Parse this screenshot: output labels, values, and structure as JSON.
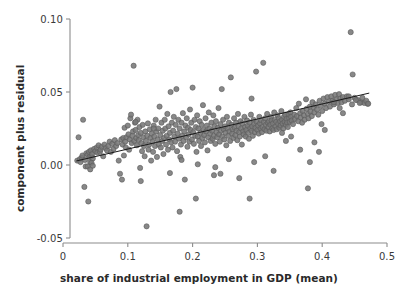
{
  "chart_data": {
    "type": "scatter",
    "title": "",
    "subtitle": "",
    "xlabel": "share of industrial employment in GDP (mean)",
    "ylabel": "component plus residual",
    "xlim": [
      0.0,
      0.5
    ],
    "ylim": [
      -0.05,
      0.1
    ],
    "xticks": [
      0,
      0.1,
      0.2,
      0.3,
      0.4,
      0.5
    ],
    "xticklabels": [
      "0",
      "0.1",
      "0.2",
      "0.3",
      "0.4",
      "0.5"
    ],
    "yticks": [
      -0.05,
      0.0,
      0.05,
      0.1
    ],
    "yticklabels": [
      "-0.05",
      "0.00",
      "0.05",
      "0.10"
    ],
    "grid": false,
    "legend": null,
    "marker": {
      "shape": "circle",
      "fill_color": "#787878",
      "edge_color": "#5a5a5a",
      "size_px": 5.2,
      "opacity": 0.88
    },
    "fit_line": {
      "name": "component-plus-residual fit",
      "color": "#1a1a1a",
      "width_px": 1.0,
      "x_start": 0.021,
      "y_start": 0.0028,
      "x_end": 0.472,
      "y_end": 0.0492,
      "slope": 0.1028,
      "intercept": 0.00064
    },
    "n_points": 402,
    "series": [
      {
        "name": "observations",
        "x": [
          0.022,
          0.024,
          0.026,
          0.027,
          0.029,
          0.03,
          0.031,
          0.033,
          0.034,
          0.035,
          0.036,
          0.038,
          0.039,
          0.04,
          0.041,
          0.042,
          0.043,
          0.044,
          0.045,
          0.046,
          0.048,
          0.05,
          0.052,
          0.053,
          0.055,
          0.057,
          0.058,
          0.06,
          0.062,
          0.064,
          0.066,
          0.068,
          0.07,
          0.072,
          0.074,
          0.076,
          0.078,
          0.08,
          0.082,
          0.084,
          0.086,
          0.088,
          0.09,
          0.091,
          0.092,
          0.093,
          0.094,
          0.095,
          0.096,
          0.097,
          0.098,
          0.1,
          0.101,
          0.102,
          0.103,
          0.104,
          0.105,
          0.106,
          0.107,
          0.108,
          0.109,
          0.11,
          0.111,
          0.112,
          0.113,
          0.114,
          0.115,
          0.116,
          0.117,
          0.118,
          0.119,
          0.12,
          0.121,
          0.122,
          0.123,
          0.124,
          0.125,
          0.126,
          0.127,
          0.128,
          0.129,
          0.13,
          0.131,
          0.132,
          0.133,
          0.134,
          0.135,
          0.136,
          0.137,
          0.138,
          0.139,
          0.14,
          0.141,
          0.142,
          0.143,
          0.144,
          0.145,
          0.146,
          0.147,
          0.148,
          0.149,
          0.15,
          0.151,
          0.152,
          0.153,
          0.154,
          0.155,
          0.156,
          0.157,
          0.158,
          0.159,
          0.16,
          0.161,
          0.162,
          0.163,
          0.164,
          0.165,
          0.166,
          0.167,
          0.168,
          0.169,
          0.17,
          0.171,
          0.172,
          0.173,
          0.174,
          0.175,
          0.176,
          0.177,
          0.178,
          0.179,
          0.18,
          0.181,
          0.182,
          0.183,
          0.184,
          0.185,
          0.186,
          0.187,
          0.188,
          0.189,
          0.19,
          0.191,
          0.192,
          0.193,
          0.194,
          0.195,
          0.196,
          0.197,
          0.198,
          0.199,
          0.2,
          0.201,
          0.202,
          0.203,
          0.204,
          0.205,
          0.206,
          0.207,
          0.208,
          0.209,
          0.21,
          0.211,
          0.212,
          0.213,
          0.214,
          0.215,
          0.216,
          0.217,
          0.218,
          0.219,
          0.22,
          0.221,
          0.222,
          0.223,
          0.224,
          0.225,
          0.226,
          0.227,
          0.228,
          0.229,
          0.23,
          0.231,
          0.232,
          0.233,
          0.234,
          0.235,
          0.236,
          0.237,
          0.238,
          0.239,
          0.24,
          0.241,
          0.242,
          0.243,
          0.244,
          0.245,
          0.246,
          0.247,
          0.248,
          0.249,
          0.25,
          0.251,
          0.252,
          0.253,
          0.254,
          0.255,
          0.256,
          0.257,
          0.258,
          0.259,
          0.26,
          0.261,
          0.262,
          0.263,
          0.264,
          0.265,
          0.266,
          0.267,
          0.268,
          0.269,
          0.27,
          0.271,
          0.272,
          0.273,
          0.274,
          0.275,
          0.276,
          0.277,
          0.278,
          0.279,
          0.28,
          0.281,
          0.282,
          0.283,
          0.284,
          0.285,
          0.286,
          0.287,
          0.288,
          0.289,
          0.29,
          0.291,
          0.292,
          0.293,
          0.294,
          0.295,
          0.296,
          0.297,
          0.298,
          0.299,
          0.3,
          0.301,
          0.302,
          0.303,
          0.304,
          0.305,
          0.306,
          0.307,
          0.308,
          0.309,
          0.31,
          0.311,
          0.312,
          0.313,
          0.314,
          0.315,
          0.316,
          0.317,
          0.318,
          0.319,
          0.32,
          0.321,
          0.322,
          0.323,
          0.324,
          0.325,
          0.326,
          0.327,
          0.328,
          0.329,
          0.33,
          0.331,
          0.332,
          0.333,
          0.334,
          0.335,
          0.336,
          0.337,
          0.338,
          0.339,
          0.34,
          0.341,
          0.342,
          0.343,
          0.344,
          0.345,
          0.346,
          0.347,
          0.348,
          0.349,
          0.35,
          0.351,
          0.352,
          0.353,
          0.355,
          0.357,
          0.358,
          0.36,
          0.361,
          0.363,
          0.364,
          0.366,
          0.367,
          0.369,
          0.37,
          0.372,
          0.373,
          0.375,
          0.376,
          0.378,
          0.379,
          0.381,
          0.382,
          0.384,
          0.385,
          0.387,
          0.388,
          0.39,
          0.392,
          0.394,
          0.396,
          0.398,
          0.4,
          0.402,
          0.404,
          0.406,
          0.408,
          0.41,
          0.412,
          0.414,
          0.416,
          0.418,
          0.42,
          0.422,
          0.424,
          0.426,
          0.428,
          0.43,
          0.432,
          0.435,
          0.438,
          0.441,
          0.444,
          0.447,
          0.45,
          0.455,
          0.46,
          0.465,
          0.47,
          0.038,
          0.042,
          0.044,
          0.046,
          0.112,
          0.14,
          0.18,
          0.183,
          0.205,
          0.233,
          0.243,
          0.256,
          0.272,
          0.288,
          0.291,
          0.295,
          0.312,
          0.325,
          0.338,
          0.344,
          0.352,
          0.366,
          0.378,
          0.381,
          0.388,
          0.395,
          0.399,
          0.404,
          0.418,
          0.427,
          0.432,
          0.441,
          0.446,
          0.452,
          0.458,
          0.462,
          0.468,
          0.471,
          0.12,
          0.165,
          0.208,
          0.235
        ],
        "y": [
          0.003,
          0.019,
          0.004,
          0.002,
          0.005,
          0.0065,
          0.031,
          -0.015,
          0.0035,
          -0.001,
          0.008,
          0.007,
          -0.025,
          0.009,
          0.0055,
          0.002,
          0.01,
          0.006,
          0.0075,
          0.0045,
          0.011,
          0.0095,
          0.012,
          0.0085,
          0.0135,
          0.009,
          0.0105,
          0.0125,
          0.006,
          0.014,
          0.0115,
          0.01,
          0.013,
          0.016,
          0.009,
          0.0145,
          0.011,
          0.017,
          0.013,
          0.015,
          0.003,
          -0.006,
          0.0175,
          -0.01,
          0.014,
          0.0185,
          0.0065,
          0.0255,
          0.016,
          0.012,
          0.019,
          0.027,
          0.021,
          0.0105,
          0.0175,
          0.032,
          0.0345,
          0.015,
          0.02,
          0.023,
          0.068,
          0.0165,
          0.029,
          0.024,
          0.0185,
          0.0135,
          0.031,
          0.0205,
          0.017,
          0.026,
          -0.002,
          0.022,
          0.015,
          0.0095,
          0.0275,
          0.019,
          0.013,
          0.006,
          0.023,
          0.0165,
          -0.042,
          0.02,
          0.0285,
          0.0105,
          0.014,
          0.0245,
          0.0185,
          0.003,
          0.0215,
          0.016,
          0.009,
          0.027,
          0.0195,
          0.013,
          0.031,
          0.023,
          0.0055,
          0.0175,
          0.025,
          0.014,
          0.04,
          0.0205,
          0.012,
          0.029,
          0.0165,
          0.0235,
          0.0075,
          0.0185,
          0.031,
          0.025,
          0.014,
          0.02,
          0.035,
          0.0105,
          0.0265,
          0.0175,
          0.022,
          0.05,
          0.0155,
          0.029,
          0.012,
          0.0235,
          0.033,
          0.0195,
          0.016,
          0.0275,
          0.052,
          0.0095,
          0.0215,
          0.031,
          0.018,
          0.025,
          0.0055,
          0.014,
          0.029,
          0.02,
          0.0355,
          0.0165,
          0.023,
          -0.01,
          0.027,
          0.019,
          0.032,
          0.0125,
          0.0255,
          0.021,
          0.016,
          0.038,
          0.024,
          0.029,
          0.0175,
          0.053,
          0.0225,
          0.0145,
          0.031,
          0.02,
          0.026,
          0.009,
          0.034,
          0.0195,
          0.025,
          0.0165,
          0.03,
          0.022,
          0.013,
          0.0275,
          0.0185,
          0.041,
          0.024,
          0.0205,
          0.0155,
          0.032,
          0.023,
          0.027,
          0.01,
          0.019,
          0.036,
          0.025,
          0.0215,
          0.0165,
          0.029,
          0.0235,
          0.018,
          0.034,
          0.02,
          0.0265,
          0.0145,
          0.03,
          0.0225,
          0.019,
          0.0255,
          0.039,
          0.021,
          0.016,
          0.028,
          0.0235,
          0.052,
          0.0195,
          0.031,
          0.0245,
          0.0175,
          0.0265,
          0.022,
          0.0135,
          0.033,
          0.025,
          0.02,
          0.029,
          0.023,
          0.0165,
          0.06,
          0.0275,
          0.0215,
          0.0245,
          0.0185,
          0.032,
          0.0255,
          0.0205,
          0.029,
          0.0235,
          0.017,
          0.035,
          0.0265,
          0.0225,
          0.0195,
          0.03,
          0.025,
          0.014,
          0.0285,
          0.023,
          0.021,
          0.033,
          0.026,
          0.0195,
          0.024,
          0.0305,
          0.027,
          0.022,
          0.018,
          0.029,
          0.025,
          0.0345,
          0.0235,
          0.0265,
          0.02,
          0.031,
          0.028,
          0.0225,
          0.0255,
          0.064,
          0.0295,
          0.024,
          0.027,
          0.0215,
          0.033,
          0.0285,
          0.025,
          0.0305,
          0.0225,
          0.026,
          0.07,
          0.0295,
          0.0245,
          0.032,
          0.0275,
          0.0235,
          0.035,
          0.029,
          0.026,
          0.03,
          0.023,
          0.0275,
          0.033,
          0.0305,
          0.025,
          0.0285,
          0.024,
          0.036,
          0.031,
          0.0265,
          0.0295,
          0.0245,
          0.034,
          0.028,
          0.032,
          0.0255,
          0.03,
          0.027,
          0.037,
          0.031,
          0.0285,
          0.025,
          0.033,
          0.0295,
          0.0345,
          0.0275,
          0.0315,
          0.029,
          0.026,
          0.035,
          0.032,
          0.0295,
          0.036,
          0.033,
          0.0305,
          0.028,
          0.0345,
          0.0315,
          0.039,
          0.0335,
          0.03,
          0.042,
          0.0355,
          0.0325,
          0.029,
          0.037,
          0.034,
          0.031,
          0.045,
          0.0385,
          0.035,
          0.032,
          0.04,
          0.0365,
          0.0335,
          0.043,
          0.0395,
          0.036,
          0.0415,
          0.038,
          0.0345,
          0.044,
          0.0405,
          0.037,
          0.0455,
          0.042,
          0.039,
          0.0465,
          0.0435,
          0.04,
          0.047,
          0.044,
          0.0415,
          0.048,
          0.045,
          0.0425,
          0.0485,
          0.0455,
          0.043,
          0.0465,
          0.044,
          0.047,
          0.045,
          0.091,
          0.062,
          0.046,
          0.0445,
          0.043,
          0.0425,
          0.042,
          -0.001,
          -0.003,
          0.0015,
          -0.0005,
          0.0295,
          0.025,
          -0.032,
          0.0035,
          -0.023,
          -0.007,
          -0.006,
          0.004,
          -0.009,
          -0.023,
          0.0455,
          0.002,
          0.006,
          -0.004,
          0.022,
          0.0165,
          0.0195,
          0.0105,
          -0.016,
          0.002,
          0.0155,
          0.009,
          0.028,
          0.024,
          0.043,
          0.039,
          0.0355,
          0.047,
          0.0415,
          0.0445,
          0.0425,
          0.046,
          0.044,
          0.042,
          -0.011,
          -0.0055,
          0.0005,
          -0.0015
        ],
        "color": "#787878"
      }
    ]
  },
  "axes_geometry": {
    "left_px": 70,
    "right_px": 390,
    "top_px": 19,
    "bottom_px": 238,
    "x_px_0": 63,
    "x_px_per_unit": 648,
    "y_px_0": 165,
    "y_px_per_unit": -1460
  },
  "style": {
    "axis_color": "#8c8c8c",
    "tick_label_color": "#3a3a3a",
    "axis_title_color": "#2a2a2a",
    "background": "#ffffff"
  }
}
